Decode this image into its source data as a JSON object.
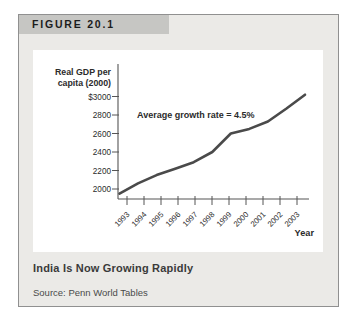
{
  "figure": {
    "label": "FIGURE 20.1",
    "caption": "India Is Now Growing Rapidly",
    "source": "Source: Penn World Tables"
  },
  "chart_data": {
    "type": "line",
    "x": [
      1993,
      1994,
      1995,
      1996,
      1997,
      1998,
      1999,
      2000,
      2001,
      2002,
      2003
    ],
    "values": [
      1950,
      2060,
      2150,
      2220,
      2290,
      2400,
      2600,
      2650,
      2730,
      2870,
      3020
    ],
    "series_name": "India real GDP per capita (2000 dollars)",
    "ylabel_lines": [
      "Real GDP per",
      "capita (2000)"
    ],
    "xlabel": "Year",
    "annotation": "Average growth rate = 4.5%",
    "yticks": [
      2000,
      2200,
      2400,
      2600,
      2800,
      3000
    ],
    "ytick_labels": [
      "2000",
      "2200",
      "2400",
      "2600",
      "2800",
      "$3000"
    ],
    "ylim": [
      1890,
      3100
    ],
    "grid": false,
    "legend": "none",
    "line_color": "#4a4a4a"
  },
  "colors": {
    "panel_bg": "#ebeae7",
    "header_bg": "#c6c6c3",
    "panel_border": "#909090",
    "chart_bg": "#ffffff",
    "line": "#4a4a4a",
    "axis": "#555555",
    "text": "#2b2b2b"
  }
}
